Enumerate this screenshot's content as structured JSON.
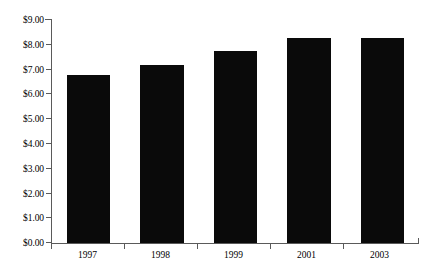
{
  "chart_data": {
    "type": "bar",
    "title": "",
    "subtitle": "",
    "xlabel": "",
    "ylabel": "",
    "categories": [
      "1997",
      "1998",
      "1999",
      "2001",
      "2003"
    ],
    "values": [
      6.75,
      7.15,
      7.7,
      8.25,
      8.25
    ],
    "ylim": [
      0,
      9
    ],
    "ytick_values": [
      9.0,
      8.0,
      7.0,
      6.0,
      5.0,
      4.0,
      3.0,
      2.0,
      1.0,
      0.0
    ],
    "ytick_labels": [
      "$9.00",
      "$8.00",
      "$7.00",
      "$6.00",
      "$5.00",
      "$4.00",
      "$3.00",
      "$2.00",
      "$1.00",
      "$0.00"
    ],
    "grid": false,
    "legend": null,
    "legend_position": "none",
    "bar_color": "#0a0a0a",
    "axis_color": "#5a5a5a",
    "background_color": "#ffffff",
    "annotations": []
  }
}
